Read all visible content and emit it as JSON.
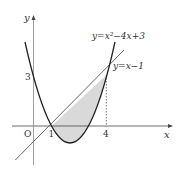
{
  "figure": {
    "axes": {
      "x_label": "x",
      "y_label": "y",
      "origin_label": "O",
      "x_ticks": [
        "1",
        "4"
      ],
      "y_ticks": [
        "3"
      ]
    },
    "curves": {
      "parabola_label": "y=x²−4x+3",
      "line_label": "y=x−1"
    },
    "shaded_region": "area between y=x−1 and y=x²−4x+3 for 1≤x≤4",
    "colors": {
      "curve": "#222222",
      "line": "#555555",
      "axis": "#444444",
      "fill": "#d9d9d9"
    }
  }
}
